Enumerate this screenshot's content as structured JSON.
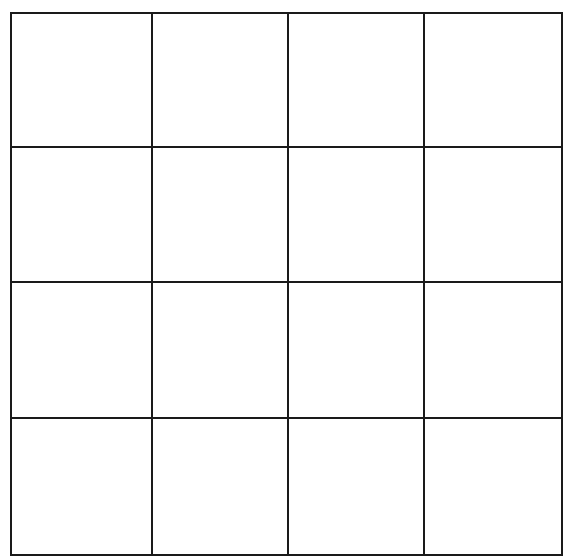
{
  "diagram": {
    "type": "grid",
    "rows": 4,
    "columns": 4,
    "cells": [
      [
        "",
        "",
        "",
        ""
      ],
      [
        "",
        "",
        "",
        ""
      ],
      [
        "",
        "",
        "",
        ""
      ],
      [
        "",
        "",
        "",
        ""
      ]
    ],
    "line_color": "#1a1a1a",
    "background_color": "#ffffff",
    "x_lines": [
      11,
      152,
      288,
      424,
      562
    ],
    "y_lines": [
      13,
      147,
      282,
      418,
      555
    ]
  }
}
